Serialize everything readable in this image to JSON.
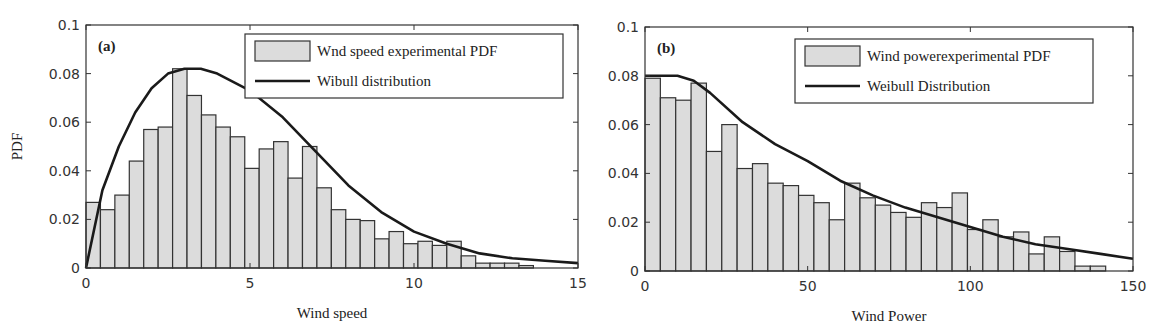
{
  "figure": {
    "width": 1149,
    "height": 335,
    "colors": {
      "bar_fill": "#dcdcdc",
      "bar_edge": "#333333",
      "curve": "#1a1a1a",
      "axis": "#333333"
    }
  },
  "chart_data": [
    {
      "type": "bar",
      "panel_label": "(a)",
      "title": "",
      "xlabel": "Wind speed",
      "ylabel": "PDF",
      "xlim": [
        0,
        15
      ],
      "ylim": [
        0,
        0.1
      ],
      "xticks": [
        0,
        5,
        10,
        15
      ],
      "xtick_labels": [
        "0",
        "5",
        "10",
        "15"
      ],
      "yticks": [
        0,
        0.02,
        0.04,
        0.06,
        0.08,
        0.1
      ],
      "ytick_labels": [
        "0",
        "0.02",
        "0.04",
        "0.06",
        "0.08",
        "0.1"
      ],
      "grid": false,
      "legend": {
        "position": "upper right",
        "entries": [
          {
            "label": "Wnd speed experimental PDF",
            "kind": "bar"
          },
          {
            "label": "Wibull distribution",
            "kind": "line"
          }
        ]
      },
      "histogram": {
        "name": "Wnd speed experimental PDF",
        "bin_start": 0,
        "bin_width": 0.44,
        "values": [
          0.027,
          0.024,
          0.03,
          0.044,
          0.057,
          0.058,
          0.082,
          0.071,
          0.063,
          0.058,
          0.054,
          0.041,
          0.049,
          0.052,
          0.037,
          0.05,
          0.033,
          0.024,
          0.02,
          0.0195,
          0.012,
          0.015,
          0.01,
          0.011,
          0.0093,
          0.011,
          0.005,
          0.002,
          0.002,
          0.002,
          0.001
        ]
      },
      "curve": {
        "name": "Wibull distribution",
        "x": [
          0,
          0.5,
          1,
          1.5,
          2,
          2.5,
          3,
          3.5,
          4,
          5,
          6,
          7,
          8,
          9,
          10,
          11,
          12,
          13,
          14,
          15
        ],
        "y": [
          0,
          0.032,
          0.05,
          0.064,
          0.074,
          0.08,
          0.082,
          0.082,
          0.08,
          0.073,
          0.062,
          0.048,
          0.034,
          0.023,
          0.015,
          0.01,
          0.006,
          0.004,
          0.003,
          0.002
        ]
      }
    },
    {
      "type": "bar",
      "panel_label": "(b)",
      "title": "",
      "xlabel": "Wind Power",
      "ylabel": "",
      "xlim": [
        0,
        150
      ],
      "ylim": [
        0,
        0.1
      ],
      "xticks": [
        0,
        50,
        100,
        150
      ],
      "xtick_labels": [
        "0",
        "50",
        "100",
        "150"
      ],
      "yticks": [
        0,
        0.02,
        0.04,
        0.06,
        0.08,
        0.1
      ],
      "ytick_labels": [
        "0",
        "0.02",
        "0.04",
        "0.06",
        "0.08",
        "0.1"
      ],
      "grid": false,
      "legend": {
        "position": "upper right",
        "entries": [
          {
            "label": "Wind powerexperimental PDF",
            "kind": "bar"
          },
          {
            "label": "Weibull Distribution",
            "kind": "line"
          }
        ]
      },
      "histogram": {
        "name": "Wind powerexperimental PDF",
        "bin_start": 0,
        "bin_width": 4.72,
        "values": [
          0.079,
          0.071,
          0.07,
          0.077,
          0.049,
          0.06,
          0.042,
          0.044,
          0.036,
          0.035,
          0.031,
          0.028,
          0.021,
          0.036,
          0.03,
          0.027,
          0.024,
          0.022,
          0.028,
          0.026,
          0.032,
          0.017,
          0.021,
          0.014,
          0.016,
          0.007,
          0.014,
          0.008,
          0.002,
          0.002
        ]
      },
      "curve": {
        "name": "Weibull Distribution",
        "x": [
          0,
          5,
          10,
          15,
          20,
          30,
          40,
          50,
          60,
          70,
          80,
          90,
          100,
          110,
          120,
          130,
          140,
          150
        ],
        "y": [
          0.08,
          0.08,
          0.08,
          0.078,
          0.073,
          0.061,
          0.052,
          0.045,
          0.037,
          0.031,
          0.026,
          0.022,
          0.018,
          0.014,
          0.011,
          0.009,
          0.007,
          0.005
        ]
      }
    }
  ],
  "layout": {
    "panels": [
      {
        "x0": 86,
        "x1": 578,
        "y0": 25,
        "y1": 268,
        "legend_box": [
          245,
          34,
          563,
          98
        ],
        "ylabel_x": 22
      },
      {
        "x0": 645,
        "x1": 1133,
        "y0": 27,
        "y1": 271,
        "legend_box": [
          795,
          39,
          1093,
          103
        ],
        "ylabel_x": null
      }
    ]
  }
}
